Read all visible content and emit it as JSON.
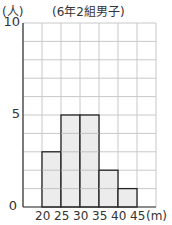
{
  "chart_data": {
    "type": "bar",
    "subtype": "histogram",
    "title": "(6年2組男子)",
    "ylabel": "(人)",
    "xlabel": "(m)",
    "bins": [
      [
        20,
        25
      ],
      [
        25,
        30
      ],
      [
        30,
        35
      ],
      [
        35,
        40
      ],
      [
        40,
        45
      ]
    ],
    "categories": [
      "20-25",
      "25-30",
      "30-35",
      "35-40",
      "40-45"
    ],
    "values": [
      3,
      5,
      5,
      2,
      1
    ],
    "x_ticks": [
      "20",
      "25",
      "30",
      "35",
      "40",
      "45"
    ],
    "y_ticks": [
      "0",
      "5",
      "10"
    ],
    "ylim": [
      0,
      10
    ],
    "xlim": [
      15,
      50
    ],
    "grid": true,
    "bar_color": "#ececec",
    "grid_color": "#c8c8c8",
    "legend": null
  },
  "labels": {
    "y_unit": "(人)",
    "title": "(6年2組男子)",
    "x_unit": "(m)",
    "y0": "0",
    "y5": "5",
    "y10": "10",
    "x20": "20",
    "x25": "25",
    "x30": "30",
    "x35": "35",
    "x40": "40",
    "x45": "45"
  }
}
